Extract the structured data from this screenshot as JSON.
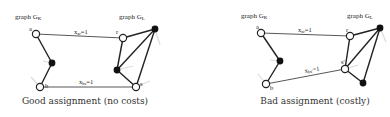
{
  "panels": [
    {
      "id": "good",
      "caption": "Good assignment (no costs)",
      "graph_k_label": "graph G",
      "graph_k_sub": "K",
      "graph_l_label": "graph G",
      "graph_l_sub": "L",
      "node_labels": {
        "a": "a",
        "b": "b",
        "r": "r",
        "s": "s"
      },
      "edge_labels": [
        {
          "main": "x",
          "sub": "ar",
          "rest": "=1"
        },
        {
          "main": "x",
          "sub": "bs",
          "rest": "=1"
        }
      ]
    },
    {
      "id": "bad",
      "caption": "Bad assignment (costly)",
      "graph_k_label": "graph G",
      "graph_k_sub": "K",
      "graph_l_label": "graph G",
      "graph_l_sub": "L",
      "node_labels": {
        "a": "a",
        "b": "b",
        "r": "r",
        "s": "s'"
      },
      "edge_labels": [
        {
          "main": "x",
          "sub": "ar",
          "rest": "=1"
        },
        {
          "main": "x",
          "sub": "bs'",
          "rest": "=1"
        }
      ]
    }
  ],
  "colors": {
    "edge": "#222222",
    "node_fill_open": "#ffffff",
    "node_fill_solid": "#111111",
    "ghost_edge": "#d8d8d8"
  }
}
